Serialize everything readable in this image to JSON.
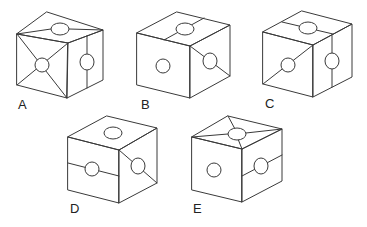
{
  "figure": {
    "title": "",
    "options": [
      {
        "label": "A",
        "label_pos": [
          18,
          98
        ]
      },
      {
        "label": "B",
        "label_pos": [
          141,
          98
        ]
      },
      {
        "label": "C",
        "label_pos": [
          265,
          97
        ]
      },
      {
        "label": "D",
        "label_pos": [
          70,
          202
        ]
      },
      {
        "label": "E",
        "label_pos": [
          193,
          202
        ]
      }
    ]
  },
  "colors": {
    "line": "#3a3a3a",
    "background": "#ffffff",
    "text": "#222222"
  }
}
